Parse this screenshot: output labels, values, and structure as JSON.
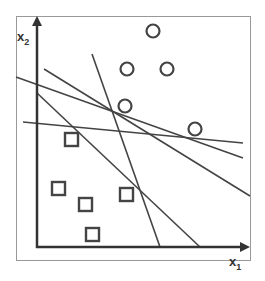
{
  "axes": {
    "x_label": "x",
    "x_sub": "1",
    "y_label": "x",
    "y_sub": "2"
  },
  "colors": {
    "stroke": "#444444",
    "frame": "#999999"
  },
  "circles": [
    {
      "cx": 153,
      "cy": 31
    },
    {
      "cx": 127,
      "cy": 69
    },
    {
      "cx": 167,
      "cy": 69
    },
    {
      "cx": 125,
      "cy": 106
    },
    {
      "cx": 195,
      "cy": 129
    }
  ],
  "squares": [
    {
      "x": 65,
      "y": 133
    },
    {
      "x": 52,
      "y": 182
    },
    {
      "x": 79,
      "y": 198
    },
    {
      "x": 120,
      "y": 188
    },
    {
      "x": 86,
      "y": 228
    }
  ],
  "lines": [
    {
      "x1": 92,
      "y1": 54,
      "x2": 160,
      "y2": 247
    },
    {
      "x1": 44,
      "y1": 69,
      "x2": 250,
      "y2": 196
    },
    {
      "x1": 16,
      "y1": 77,
      "x2": 243,
      "y2": 158
    },
    {
      "x1": 23,
      "y1": 122,
      "x2": 243,
      "y2": 143
    },
    {
      "x1": 37,
      "y1": 93,
      "x2": 200,
      "y2": 247
    }
  ]
}
